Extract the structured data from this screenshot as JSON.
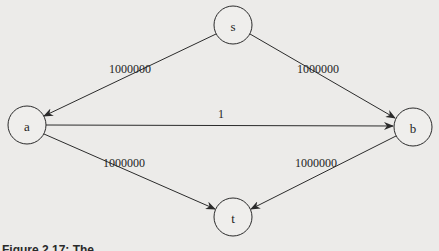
{
  "diagram": {
    "type": "directed-graph",
    "nodes": [
      {
        "id": "s",
        "label": "s",
        "cx": 233,
        "cy": 25,
        "r": 19
      },
      {
        "id": "a",
        "label": "a",
        "cx": 27,
        "cy": 125,
        "r": 19
      },
      {
        "id": "b",
        "label": "b",
        "cx": 413,
        "cy": 127,
        "r": 19
      },
      {
        "id": "t",
        "label": "t",
        "cx": 233,
        "cy": 217,
        "r": 19
      }
    ],
    "edges": [
      {
        "from": "s",
        "to": "a",
        "label": "1000000"
      },
      {
        "from": "s",
        "to": "b",
        "label": "1000000"
      },
      {
        "from": "a",
        "to": "b",
        "label": "1"
      },
      {
        "from": "a",
        "to": "t",
        "label": "1000000"
      },
      {
        "from": "b",
        "to": "t",
        "label": "1000000"
      }
    ]
  },
  "caption": "Figure 2.17: The ..."
}
